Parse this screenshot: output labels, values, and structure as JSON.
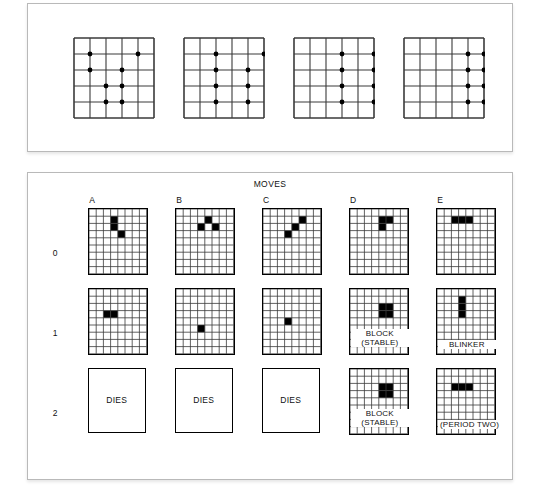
{
  "figure": {
    "top_panel": {
      "caption": "",
      "grid_cols": 5,
      "grid_rows": 5,
      "lattices": [
        {
          "name": "lattice-1",
          "dots": [
            [
              1,
              1
            ],
            [
              4,
              1
            ],
            [
              1,
              2
            ],
            [
              3,
              2
            ],
            [
              2,
              3
            ],
            [
              3,
              3
            ],
            [
              2,
              4
            ],
            [
              3,
              4
            ]
          ]
        },
        {
          "name": "lattice-2",
          "dots": [
            [
              2,
              1
            ],
            [
              5,
              1
            ],
            [
              2,
              2
            ],
            [
              4,
              2
            ],
            [
              2,
              3
            ],
            [
              4,
              3
            ],
            [
              2,
              4
            ],
            [
              4,
              4
            ]
          ]
        },
        {
          "name": "lattice-3",
          "dots": [
            [
              3,
              1
            ],
            [
              5,
              1
            ],
            [
              3,
              2
            ],
            [
              5,
              2
            ],
            [
              3,
              3
            ],
            [
              5,
              3
            ],
            [
              3,
              4
            ],
            [
              5,
              4
            ]
          ]
        },
        {
          "name": "lattice-4",
          "dots": [
            [
              4,
              1
            ],
            [
              5,
              1
            ],
            [
              4,
              2
            ],
            [
              5,
              2
            ],
            [
              4,
              3
            ],
            [
              5,
              3
            ],
            [
              4,
              4
            ],
            [
              5,
              4
            ]
          ]
        }
      ]
    },
    "bottom_panel": {
      "title": "MOVES",
      "column_headers": [
        "A",
        "B",
        "C",
        "D",
        "E"
      ],
      "row_labels": [
        "0",
        "1",
        "2"
      ],
      "grid_cols": 8,
      "grid_rows": 9,
      "columns": [
        {
          "id": "A",
          "cells": {
            "0": [
              [
                4,
                2
              ],
              [
                4,
                3
              ],
              [
                5,
                4
              ]
            ],
            "1": [
              [
                3,
                4
              ],
              [
                4,
                4
              ]
            ]
          },
          "outcome": "DIES",
          "outcome_kind": "diebox"
        },
        {
          "id": "B",
          "cells": {
            "0": [
              [
                5,
                2
              ],
              [
                4,
                3
              ],
              [
                6,
                3
              ]
            ],
            "1": [
              [
                4,
                6
              ]
            ]
          },
          "outcome": "DIES",
          "outcome_kind": "diebox"
        },
        {
          "id": "C",
          "cells": {
            "0": [
              [
                6,
                2
              ],
              [
                5,
                3
              ],
              [
                4,
                4
              ]
            ],
            "1": [
              [
                4,
                5
              ]
            ]
          },
          "outcome": "DIES",
          "outcome_kind": "diebox"
        },
        {
          "id": "D",
          "cells": {
            "0": [
              [
                5,
                2
              ],
              [
                5,
                3
              ],
              [
                6,
                2
              ]
            ],
            "1": [
              [
                5,
                3
              ],
              [
                6,
                3
              ],
              [
                5,
                4
              ],
              [
                6,
                4
              ]
            ],
            "2": [
              [
                5,
                3
              ],
              [
                6,
                3
              ],
              [
                5,
                4
              ],
              [
                6,
                4
              ]
            ]
          },
          "annotations": [
            {
              "name": "block-stable-row1",
              "lines": [
                "BLOCK",
                "(STABLE)"
              ]
            },
            {
              "name": "block-stable-row2",
              "lines": [
                "BLOCK",
                "(STABLE)"
              ]
            }
          ],
          "outcome": "BLOCK (STABLE)",
          "outcome_kind": "pattern"
        },
        {
          "id": "E",
          "cells": {
            "0": [
              [
                3,
                2
              ],
              [
                4,
                2
              ],
              [
                5,
                2
              ]
            ],
            "1": [
              [
                4,
                2
              ],
              [
                4,
                3
              ],
              [
                4,
                4
              ]
            ],
            "2": [
              [
                3,
                3
              ],
              [
                4,
                3
              ],
              [
                5,
                3
              ]
            ]
          },
          "annotations": [
            {
              "name": "blinker-label",
              "lines": [
                "BLINKER"
              ]
            },
            {
              "name": "period-two-label",
              "lines": [
                "(PERIOD TWO)"
              ]
            }
          ],
          "outcome": "BLINKER (PERIOD TWO)",
          "outcome_kind": "pattern"
        }
      ]
    }
  },
  "colors": {
    "ink": "#000000",
    "paper": "#ffffff",
    "panel_border": "#b9b9b9",
    "grid_line": "#3a3a3a"
  }
}
